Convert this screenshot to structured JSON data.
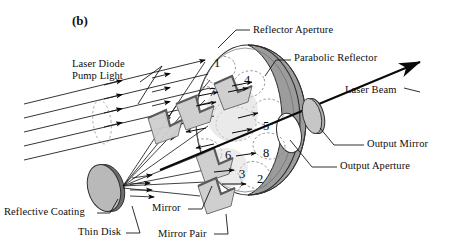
{
  "figure": {
    "panel_label": "(b)",
    "caption_subject": "thin-disk laser multi-pass pump cavity with parabolic reflector"
  },
  "callouts": [
    {
      "id": "laser-diode-pump-light",
      "line1": "Laser Diode",
      "line2": "Pump Light",
      "x": 72,
      "y": 58
    },
    {
      "id": "reflector-aperture",
      "line1": "Reflector Aperture",
      "line2": "",
      "x": 253,
      "y": 24
    },
    {
      "id": "parabolic-reflector",
      "line1": "Parabolic Reflector",
      "line2": "",
      "x": 294,
      "y": 52
    },
    {
      "id": "laser-beam",
      "line1": "Laser Beam",
      "line2": "",
      "x": 368,
      "y": 88
    },
    {
      "id": "output-mirror",
      "line1": "Output Mirror",
      "line2": "",
      "x": 367,
      "y": 141
    },
    {
      "id": "output-aperture",
      "line1": "Output Aperture",
      "line2": "",
      "x": 340,
      "y": 163
    },
    {
      "id": "reflective-coating",
      "line1": "Reflective Coating",
      "line2": "",
      "x": 6,
      "y": 215
    },
    {
      "id": "thin-disk",
      "line1": "Thin Disk",
      "line2": "",
      "x": 76,
      "y": 231
    },
    {
      "id": "mirror",
      "line1": "Mirror",
      "line2": "",
      "x": 155,
      "y": 206
    },
    {
      "id": "mirror-pair",
      "line1": "Mirror Pair",
      "line2": "",
      "x": 160,
      "y": 232
    }
  ],
  "pass_numbers": [
    {
      "label": "1",
      "x": 214,
      "y": 58
    },
    {
      "label": "4",
      "x": 244,
      "y": 74
    },
    {
      "label": "5",
      "x": 264,
      "y": 120
    },
    {
      "label": "8",
      "x": 264,
      "y": 147
    },
    {
      "label": "2",
      "x": 258,
      "y": 173
    },
    {
      "label": "3",
      "x": 240,
      "y": 169
    },
    {
      "label": "6",
      "x": 226,
      "y": 149
    },
    {
      "label": "7",
      "x": 210,
      "y": 86
    }
  ],
  "colors": {
    "ink": "#0a0a0a",
    "reflector_fill": "#9e9e9e",
    "reflector_stroke": "#3a3a3a",
    "disk_fill": "#b5b5b5",
    "mirror_fill": "#c9c9c9",
    "mirror_edge": "#6f6f6f",
    "aperture_fill": "#ffffff",
    "dashed_spot": "#7a7a7a",
    "background": "#ffffff"
  },
  "geometry": {
    "reflector_center_x": 268,
    "reflector_center_y": 120,
    "reflector_rx": 62,
    "reflector_ry": 78,
    "disk_x": 105,
    "disk_y": 188,
    "output_mirror_x": 312,
    "output_mirror_y": 112,
    "pump_beam_count": 5,
    "pass_count": 8
  }
}
